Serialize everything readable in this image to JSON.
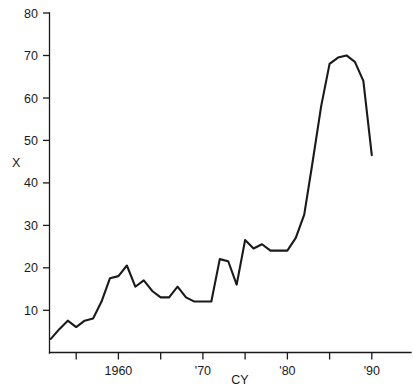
{
  "chart_data": {
    "type": "line",
    "title": "",
    "xlabel": "CY",
    "ylabel": "X",
    "xlim": [
      1952,
      1991
    ],
    "ylim": [
      0,
      80
    ],
    "grid": false,
    "legend": null,
    "y_ticks": [
      0,
      10,
      20,
      30,
      40,
      50,
      60,
      70,
      80
    ],
    "y_tick_labels": [
      "",
      "10",
      "20",
      "30",
      "40",
      "50",
      "60",
      "70",
      "80"
    ],
    "x_ticks": [
      1955,
      1960,
      1965,
      1970,
      1975,
      1980,
      1985,
      1990
    ],
    "x_tick_labels": [
      "",
      "1960",
      "",
      "'70",
      "",
      "'80",
      "",
      "'90"
    ],
    "series": [
      {
        "name": "X",
        "x": [
          1952,
          1953,
          1954,
          1955,
          1956,
          1957,
          1958,
          1959,
          1960,
          1961,
          1962,
          1963,
          1964,
          1965,
          1966,
          1967,
          1968,
          1969,
          1970,
          1971,
          1972,
          1973,
          1974,
          1975,
          1976,
          1977,
          1978,
          1979,
          1980,
          1981,
          1982,
          1983,
          1984,
          1985,
          1986,
          1987,
          1988,
          1989,
          1990
        ],
        "values": [
          3.2,
          5.5,
          7.5,
          6.0,
          7.5,
          8.0,
          12.0,
          17.5,
          18.0,
          20.5,
          15.5,
          17.0,
          14.5,
          13.0,
          13.0,
          15.5,
          13.0,
          12.0,
          12.0,
          12.0,
          22.0,
          21.5,
          16.0,
          26.5,
          24.5,
          25.5,
          24.0,
          24.0,
          24.0,
          27.0,
          32.5,
          45.0,
          58.0,
          68.0,
          69.5,
          70.0,
          68.5,
          64.0,
          46.5
        ]
      }
    ]
  },
  "axis": {
    "y_label_text": "X",
    "x_label_text": "CY"
  }
}
